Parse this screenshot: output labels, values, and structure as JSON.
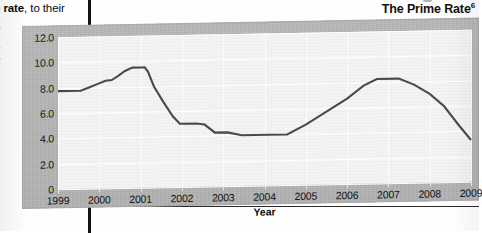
{
  "page": {
    "body_text_left_line1_bold": "e rate",
    "body_text_left_line1_rest": ", to their",
    "body_text_left_line2": ":-"
  },
  "figure": {
    "title": "The Prime Rate",
    "title_footnote": "6"
  },
  "chart_data": {
    "type": "line",
    "title": "The Prime Rate",
    "xlabel": "Year",
    "ylabel": "Interest Rate (%)",
    "xlim": [
      1999,
      2009
    ],
    "ylim": [
      0,
      12
    ],
    "grid": true,
    "legend": "none",
    "line_color": "#4a4a4a",
    "panel_color": "#b3b3b3",
    "plot_color": "#f4f4f4",
    "ytick_labels": [
      "0",
      "2.0",
      "4.0",
      "6.0",
      "8.0",
      "10.0",
      "12.0"
    ],
    "ytick_values": [
      0,
      2,
      4,
      6,
      8,
      10,
      12
    ],
    "xtick_labels": [
      "1999",
      "2000",
      "2001",
      "2002",
      "2003",
      "2004",
      "2005",
      "2006",
      "2007",
      "2008",
      "2009"
    ],
    "xtick_values": [
      1999,
      2000,
      2001,
      2002,
      2003,
      2004,
      2005,
      2006,
      2007,
      2008,
      2009
    ],
    "series": [
      {
        "name": "Prime Rate",
        "x": [
          1999.0,
          1999.55,
          1999.75,
          1999.95,
          2000.15,
          2000.3,
          2000.45,
          2000.62,
          2000.8,
          2001.02,
          2001.1,
          2001.18,
          2001.32,
          2001.55,
          2001.78,
          2001.95,
          2002.35,
          2002.55,
          2002.8,
          2003.1,
          2003.45,
          2004.1,
          2004.55,
          2005.0,
          2005.5,
          2006.0,
          2006.4,
          2006.72,
          2007.25,
          2007.62,
          2008.0,
          2008.35,
          2008.7,
          2009.0
        ],
        "y": [
          7.75,
          7.75,
          8.0,
          8.25,
          8.5,
          8.55,
          8.85,
          9.25,
          9.5,
          9.5,
          9.5,
          9.15,
          8.0,
          6.75,
          5.6,
          5.0,
          5.0,
          4.9,
          4.25,
          4.25,
          4.0,
          4.0,
          4.0,
          4.75,
          5.75,
          6.75,
          7.75,
          8.25,
          8.25,
          7.75,
          7.0,
          6.0,
          4.5,
          3.3
        ]
      }
    ]
  }
}
